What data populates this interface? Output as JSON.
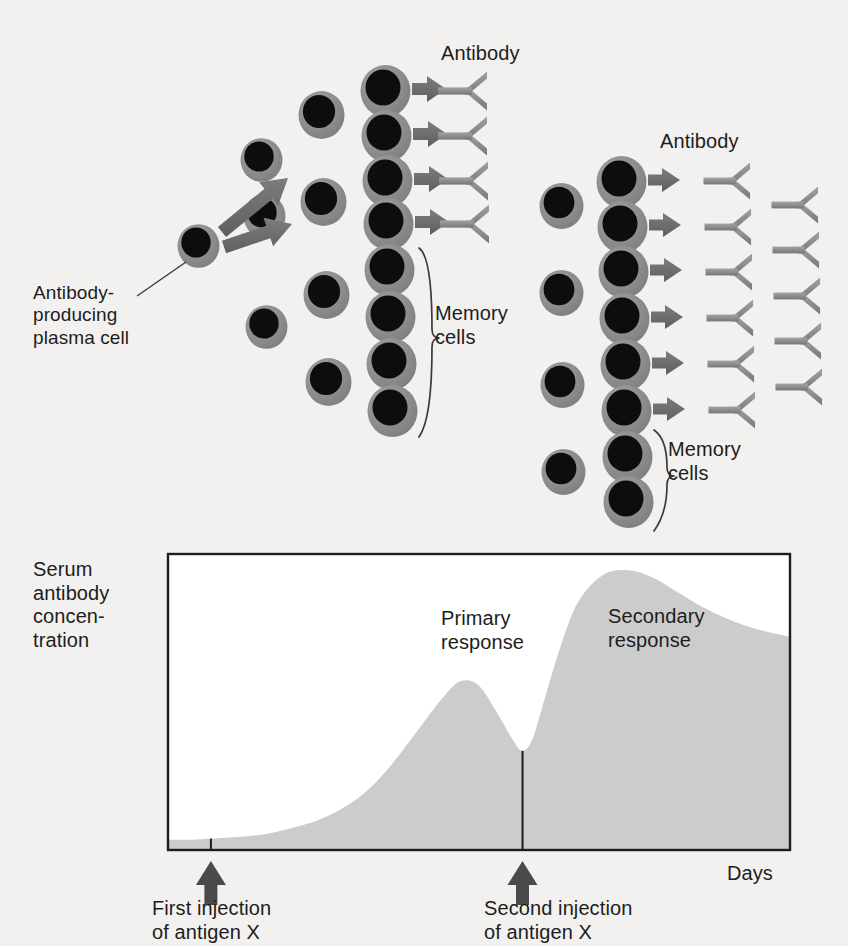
{
  "figure": {
    "background_color": "#f2f1ef",
    "cell_fill": "#0d0d0d",
    "cell_ring": "#8f8f8f",
    "arrow_color": "#6a6a6a",
    "antibody_color": "#8a8a8a",
    "curve_fill": "#cccccc",
    "axis_color": "#1d1d1d"
  },
  "labels": {
    "antibody_left": "Antibody",
    "antibody_right": "Antibody",
    "memory_cells_left": "Memory\ncells",
    "memory_cells_left_line1": "Memory",
    "memory_cells_left_line2": "cells",
    "memory_cells_right_line1": "Memory",
    "memory_cells_right_line2": "cells",
    "plasma_cell_line1": "Antibody-",
    "plasma_cell_line2": "producing",
    "plasma_cell_line3": "plasma cell",
    "y_axis_line1": "Serum",
    "y_axis_line2": "antibody",
    "y_axis_line3": "concen-",
    "y_axis_line4": "tration",
    "primary_line1": "Primary",
    "primary_line2": "response",
    "secondary_line1": "Secondary",
    "secondary_line2": "response",
    "first_injection_line1": "First injection",
    "first_injection_line2": "of antigen X",
    "second_injection_line1": "Second injection",
    "second_injection_line2": "of antigen X",
    "x_axis": "Days"
  },
  "cells": {
    "source": {
      "cx": 197,
      "cy": 244,
      "r": 21
    },
    "left_col2": [
      {
        "cx": 260,
        "cy": 158,
        "r": 21
      },
      {
        "cx": 263,
        "cy": 214,
        "r": 21
      },
      {
        "cx": 265,
        "cy": 325,
        "r": 21
      }
    ],
    "left_col3": [
      {
        "cx": 320,
        "cy": 113,
        "r": 23
      },
      {
        "cx": 322,
        "cy": 200,
        "r": 23
      },
      {
        "cx": 325,
        "cy": 293,
        "r": 23
      },
      {
        "cx": 327,
        "cy": 380,
        "r": 23
      }
    ],
    "left_col4": [
      {
        "cx": 384,
        "cy": 89,
        "r": 25
      },
      {
        "cx": 385,
        "cy": 134,
        "r": 25
      },
      {
        "cx": 386,
        "cy": 179,
        "r": 25
      },
      {
        "cx": 387,
        "cy": 222,
        "r": 25
      },
      {
        "cx": 388,
        "cy": 268,
        "r": 25
      },
      {
        "cx": 389,
        "cy": 315,
        "r": 25
      },
      {
        "cx": 390,
        "cy": 362,
        "r": 25
      },
      {
        "cx": 391,
        "cy": 409,
        "r": 25
      }
    ],
    "right_col1": [
      {
        "cx": 560,
        "cy": 204,
        "r": 22
      },
      {
        "cx": 560,
        "cy": 291,
        "r": 22
      },
      {
        "cx": 561,
        "cy": 383,
        "r": 22
      },
      {
        "cx": 562,
        "cy": 470,
        "r": 22
      }
    ],
    "right_col2": [
      {
        "cx": 620,
        "cy": 180,
        "r": 25
      },
      {
        "cx": 621,
        "cy": 225,
        "r": 25
      },
      {
        "cx": 622,
        "cy": 270,
        "r": 25
      },
      {
        "cx": 623,
        "cy": 317,
        "r": 25
      },
      {
        "cx": 624,
        "cy": 363,
        "r": 25
      },
      {
        "cx": 625,
        "cy": 409,
        "r": 25
      },
      {
        "cx": 626,
        "cy": 455,
        "r": 25
      },
      {
        "cx": 627,
        "cy": 500,
        "r": 25
      }
    ]
  },
  "arrows": {
    "source_to_upper": {
      "x1": 222,
      "y1": 232,
      "x2": 288,
      "y2": 178
    },
    "source_to_lower": {
      "x1": 224,
      "y1": 247,
      "x2": 292,
      "y2": 224
    },
    "left_row_arrows_count": 4,
    "right_row_arrows_count": 6
  },
  "antibodies": {
    "left_column": [
      {
        "x": 438,
        "y": 91
      },
      {
        "x": 438,
        "y": 136
      },
      {
        "x": 439,
        "y": 181
      },
      {
        "x": 440,
        "y": 224
      }
    ],
    "right_column_inner": [
      {
        "x": 704,
        "y": 181
      },
      {
        "x": 705,
        "y": 227
      },
      {
        "x": 706,
        "y": 272
      },
      {
        "x": 707,
        "y": 318
      },
      {
        "x": 708,
        "y": 364
      },
      {
        "x": 709,
        "y": 410
      }
    ],
    "right_column_outer": [
      {
        "x": 772,
        "y": 205
      },
      {
        "x": 773,
        "y": 250
      },
      {
        "x": 774,
        "y": 296
      },
      {
        "x": 775,
        "y": 341
      },
      {
        "x": 776,
        "y": 387
      }
    ]
  },
  "brackets": {
    "memory_left": {
      "x": 420,
      "y_top": 248,
      "y_bottom": 428
    },
    "memory_right": {
      "x": 655,
      "y_top": 430,
      "y_bottom": 522
    }
  },
  "chart_data": {
    "type": "area",
    "xlabel": "Days",
    "ylabel": "Serum antibody concentration",
    "grid": false,
    "legend": null,
    "plot_box": {
      "left": 168,
      "top": 554,
      "right": 790,
      "bottom": 850
    },
    "annotations": [
      {
        "text": "Primary response",
        "x_frac": 0.46,
        "y_frac": 0.25
      },
      {
        "text": "Secondary response",
        "x_frac": 0.63,
        "y_frac": 0.23
      }
    ],
    "events": [
      {
        "label": "First injection of antigen X",
        "x_frac": 0.069,
        "marker": "tick+arrow"
      },
      {
        "label": "Second injection of antigen X",
        "x_frac": 0.57,
        "marker": "tick+arrow"
      }
    ],
    "series": [
      {
        "name": "Serum antibody concentration",
        "x": [
          0,
          0.04,
          0.08,
          0.12,
          0.16,
          0.2,
          0.24,
          0.28,
          0.32,
          0.36,
          0.4,
          0.44,
          0.47,
          0.5,
          0.53,
          0.555,
          0.57,
          0.585,
          0.6,
          0.63,
          0.66,
          0.7,
          0.74,
          0.78,
          0.82,
          0.86,
          0.9,
          0.94,
          1.0
        ],
        "y": [
          0.035,
          0.035,
          0.04,
          0.045,
          0.055,
          0.075,
          0.1,
          0.14,
          0.2,
          0.29,
          0.4,
          0.51,
          0.57,
          0.555,
          0.46,
          0.37,
          0.335,
          0.37,
          0.47,
          0.68,
          0.84,
          0.93,
          0.945,
          0.92,
          0.87,
          0.82,
          0.78,
          0.75,
          0.72
        ]
      }
    ],
    "ylim": [
      0,
      1
    ],
    "xlim": [
      0,
      1
    ],
    "y_tick_labels": [],
    "x_tick_labels": []
  }
}
